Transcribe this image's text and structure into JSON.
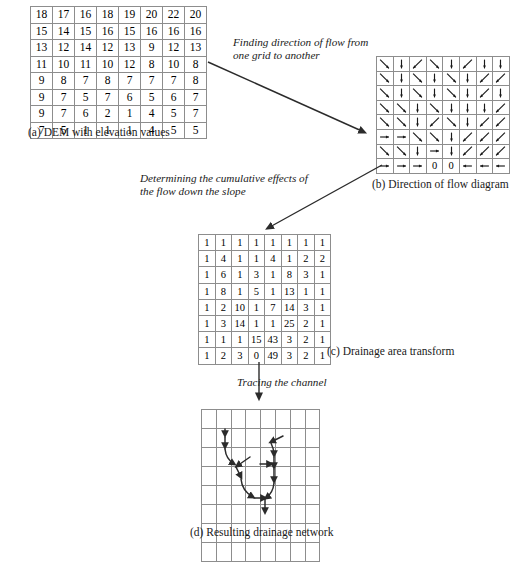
{
  "figure": {
    "background": "#ffffff",
    "line_color": "#3a3a3a",
    "grid_color": "#8d8d8d"
  },
  "panel_a": {
    "caption": "(a) DEM with elevation values",
    "rows": [
      [
        18,
        17,
        16,
        18,
        19,
        20,
        22,
        20
      ],
      [
        15,
        14,
        15,
        16,
        15,
        16,
        16,
        16
      ],
      [
        13,
        12,
        14,
        12,
        13,
        9,
        12,
        13
      ],
      [
        11,
        10,
        11,
        10,
        12,
        8,
        10,
        8
      ],
      [
        9,
        8,
        7,
        8,
        7,
        7,
        7,
        8
      ],
      [
        9,
        7,
        5,
        7,
        6,
        5,
        6,
        7
      ],
      [
        9,
        7,
        6,
        2,
        1,
        4,
        5,
        7
      ],
      [
        7,
        5,
        1,
        1,
        1,
        4,
        5,
        5
      ]
    ]
  },
  "panel_b": {
    "caption": "(b) Direction of flow diagram",
    "rows": [
      [
        "SE",
        "S",
        "SW",
        "SE",
        "S",
        "SW",
        "S",
        "S"
      ],
      [
        "SE",
        "S",
        "SE",
        "S",
        "SE",
        "S",
        "SW",
        "SW"
      ],
      [
        "SE",
        "S",
        "SE",
        "S",
        "SE",
        "S",
        "SW",
        "S"
      ],
      [
        "SE",
        "SE",
        "S",
        "SE",
        "S",
        "S",
        "S",
        "SW"
      ],
      [
        "SE",
        "SE",
        "S",
        "SW",
        "SE",
        "S",
        "SW",
        "SW"
      ],
      [
        "E",
        "E",
        "SE",
        "SE",
        "S",
        "SW",
        "SW",
        "SW"
      ],
      [
        "SE",
        "SE",
        "S",
        "E",
        "S",
        "SW",
        "SW",
        "SW"
      ],
      [
        "E",
        "E",
        "E",
        "0",
        "0",
        "W",
        "W",
        "W"
      ]
    ]
  },
  "panel_c": {
    "caption": "(c) Drainage area transform",
    "rows": [
      [
        1,
        1,
        1,
        1,
        1,
        1,
        1,
        1
      ],
      [
        1,
        4,
        1,
        1,
        4,
        1,
        2,
        2
      ],
      [
        1,
        6,
        1,
        3,
        1,
        8,
        3,
        1
      ],
      [
        1,
        8,
        1,
        5,
        1,
        13,
        1,
        1
      ],
      [
        1,
        2,
        10,
        1,
        7,
        14,
        3,
        1
      ],
      [
        1,
        3,
        14,
        1,
        1,
        25,
        2,
        1
      ],
      [
        1,
        1,
        1,
        15,
        43,
        3,
        2,
        1
      ],
      [
        1,
        2,
        3,
        0,
        49,
        3,
        2,
        1
      ]
    ]
  },
  "panel_d": {
    "caption": "(d) Resulting drainage network",
    "grid_cols": 8,
    "grid_rows": 8
  },
  "annotations": {
    "step1": "Finding direction of flow from one grid to another",
    "step2": "Determining the cumulative effects of the flow down the slope",
    "step3": "Tracing the channel"
  }
}
